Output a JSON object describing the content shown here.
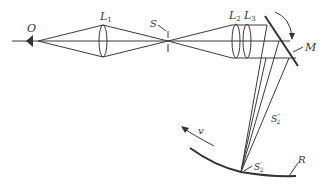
{
  "diagram": {
    "type": "optics-schematic",
    "labels": {
      "observer": "O",
      "lens1": "L",
      "lens1_sub": "1",
      "slit": "S",
      "lens2": "L",
      "lens2_sub": "2",
      "lens3": "L",
      "lens3_sub": "3",
      "mirror": "M",
      "image_primary": "S",
      "image_primary_sub": "2",
      "image_primary_prime": "'",
      "image_secondary": "S",
      "image_secondary_sub": "2",
      "image_secondary_prime": "''",
      "screen": "R",
      "velocity": "v"
    },
    "colors": {
      "line": "#3a3a3a",
      "text": "#333333",
      "background": "#ffffff"
    }
  }
}
